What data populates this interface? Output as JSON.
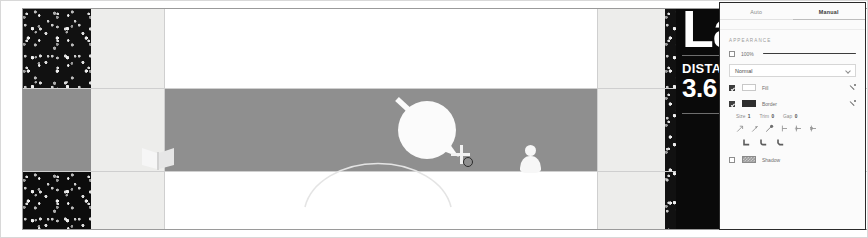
{
  "canvas": {
    "name": "map-canvas",
    "background_color": "#ffffff",
    "road_band_color": "#8f8f8f",
    "path_strip_color": "#ededeb",
    "vegetation_color": "#111111",
    "annotation_color": "#fbfbfb"
  },
  "overlay_card": {
    "title": "La",
    "kicker": "DISTA",
    "value": "3.6 m",
    "background_color": "#0a0a0a",
    "text_color": "#ffffff"
  },
  "inspector": {
    "name": "appearance-inspector",
    "tabs": [
      {
        "label": "Auto",
        "active": false
      },
      {
        "label": "Manual",
        "active": true
      }
    ],
    "section_label": "APPEARANCE",
    "opacity": {
      "label": "100%",
      "checkbox_checked": false,
      "slider_value": 100
    },
    "blend_mode": {
      "label": "Blend Mode",
      "value": "Normal"
    },
    "fill": {
      "label": "Fill",
      "checked": true,
      "color": "#ffffff",
      "eyedropper": "eyedropper-icon"
    },
    "border": {
      "label": "Border",
      "checked": true,
      "color": "#2e2e2e",
      "eyedropper": "eyedropper-icon"
    },
    "stroke_steppers": [
      {
        "label": "Size",
        "value": "1"
      },
      {
        "label": "Trim",
        "value": "0"
      },
      {
        "label": "Gap",
        "value": "0"
      }
    ],
    "endpoint_buttons": [
      {
        "name": "arrow-start-icon"
      },
      {
        "name": "arrow-mid-icon"
      },
      {
        "name": "arrow-end-icon"
      },
      {
        "name": "line-cap-butt-icon"
      },
      {
        "name": "line-cap-round-icon"
      },
      {
        "name": "line-cap-square-icon"
      }
    ],
    "joint_buttons": [
      {
        "name": "corner-miter-icon"
      },
      {
        "name": "corner-round-icon"
      },
      {
        "name": "corner-bevel-icon"
      }
    ],
    "shadow": {
      "label": "Shadow",
      "checked": false,
      "color": "#9c9c9c"
    }
  }
}
